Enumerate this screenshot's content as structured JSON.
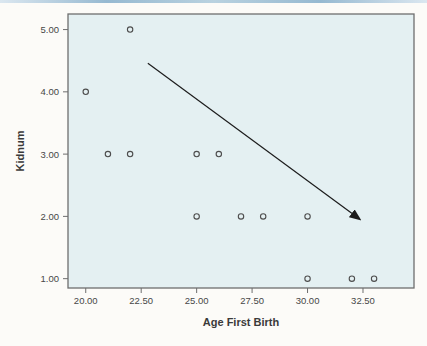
{
  "page": {
    "background": "#fcfbf8",
    "top_rule_colors": [
      "#dbe7f0",
      "#96b9d1",
      "#b9d2e0",
      "#96b9d1",
      "#dbe7f0"
    ]
  },
  "chart_data": {
    "type": "scatter",
    "title": "",
    "xlabel": "Age First Birth",
    "ylabel": "Kidnum",
    "xlim": [
      19.2,
      34.8
    ],
    "ylim": [
      0.85,
      5.25
    ],
    "grid": false,
    "legend": null,
    "x_ticks": [
      20,
      22.5,
      25,
      27.5,
      30,
      32.5
    ],
    "x_tick_labels": [
      "20.00",
      "22.50",
      "25.00",
      "27.50",
      "30.00",
      "32.50"
    ],
    "y_ticks": [
      1,
      2,
      3,
      4,
      5
    ],
    "y_tick_labels": [
      "1.00",
      "2.00",
      "3.00",
      "4.00",
      "5.00"
    ],
    "points": [
      [
        22,
        5
      ],
      [
        20,
        4
      ],
      [
        21,
        3
      ],
      [
        22,
        3
      ],
      [
        25,
        3
      ],
      [
        26,
        3
      ],
      [
        25,
        2
      ],
      [
        27,
        2
      ],
      [
        28,
        2
      ],
      [
        30,
        2
      ],
      [
        30,
        1
      ],
      [
        32,
        1
      ],
      [
        33,
        1
      ]
    ],
    "annotation_arrow": {
      "from": [
        22.8,
        4.46
      ],
      "to": [
        32.3,
        1.97
      ]
    },
    "colors": {
      "plot_bg": "#e4f0f2",
      "frame": "#6e6e6e",
      "marker": "#4d4d4d",
      "arrow": "#1c1c1c",
      "tick_text": "#474747",
      "label_text": "#3a3a3a"
    }
  }
}
